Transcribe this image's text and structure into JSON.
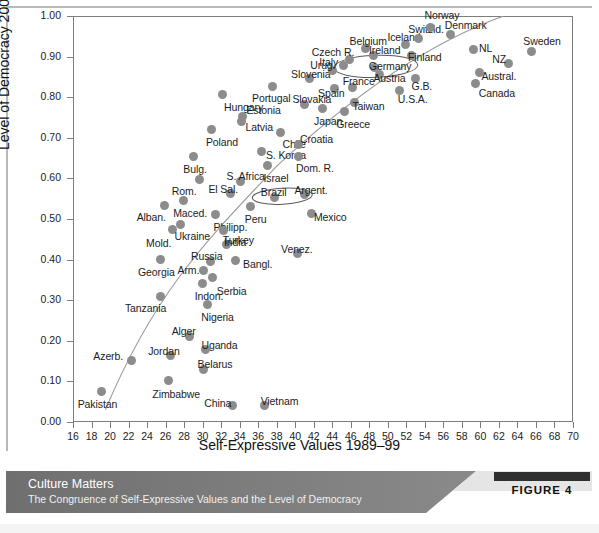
{
  "chart_data": {
    "type": "scatter",
    "title": "",
    "xlabel": "Self-Expressive Values 1989–99",
    "ylabel": "Level of Democracy 2000–04",
    "xlim": [
      16,
      70
    ],
    "ylim": [
      0.0,
      1.0
    ],
    "xticks": [
      16,
      18,
      20,
      22,
      24,
      26,
      28,
      30,
      32,
      34,
      36,
      38,
      40,
      42,
      44,
      46,
      48,
      50,
      52,
      54,
      56,
      58,
      60,
      62,
      64,
      66,
      68,
      70
    ],
    "yticks": [
      "0.00",
      "0.10",
      "0.20",
      "0.30",
      "0.40",
      "0.50",
      "0.60",
      "0.70",
      "0.80",
      "0.90",
      "1.00"
    ],
    "grid": false,
    "legend": "none",
    "marker_color": "#8c8c8c",
    "trendline_color": "#9a9a9a",
    "annotations": [
      {
        "name": "germany-ellipse",
        "label": "Germany"
      },
      {
        "name": "brazil-ellipse",
        "label": "Brazil"
      }
    ],
    "points": [
      {
        "label": "Pakistan",
        "x": 19.1,
        "y": 0.075,
        "lx": -24,
        "ly": 12
      },
      {
        "label": "Azerb.",
        "x": 22.3,
        "y": 0.152,
        "lx": -38,
        "ly": -4
      },
      {
        "label": "Tanzania",
        "x": 25.5,
        "y": 0.31,
        "lx": -36,
        "ly": 12
      },
      {
        "label": "Georgia",
        "x": 25.4,
        "y": 0.4,
        "lx": -22,
        "ly": 12
      },
      {
        "label": "Zimbabwe",
        "x": 26.3,
        "y": 0.101,
        "lx": -16,
        "ly": 13
      },
      {
        "label": "Jordan",
        "x": 26.5,
        "y": 0.163,
        "lx": -22,
        "ly": -5
      },
      {
        "label": "Alban.",
        "x": 25.9,
        "y": 0.534,
        "lx": -28,
        "ly": 12
      },
      {
        "label": "Mold.",
        "x": 26.7,
        "y": 0.474,
        "lx": -26,
        "ly": 13
      },
      {
        "label": "Maced.",
        "x": 27.9,
        "y": 0.545,
        "lx": -10,
        "ly": 12
      },
      {
        "label": "Ukraine",
        "x": 27.6,
        "y": 0.487,
        "lx": -6,
        "ly": 12
      },
      {
        "label": "Alger",
        "x": 28.6,
        "y": 0.211,
        "lx": -18,
        "ly": -5
      },
      {
        "label": "Uganda",
        "x": 30.3,
        "y": 0.178,
        "lx": -4,
        "ly": -5
      },
      {
        "label": "Belarus",
        "x": 30.1,
        "y": 0.13,
        "lx": -6,
        "ly": -5
      },
      {
        "label": "Nigeria",
        "x": 30.5,
        "y": 0.289,
        "lx": -6,
        "ly": 12
      },
      {
        "label": "Russia",
        "x": 30.9,
        "y": 0.396,
        "lx": -20,
        "ly": -5
      },
      {
        "label": "Arm.",
        "x": 30.1,
        "y": 0.372,
        "lx": -26,
        "ly": -1
      },
      {
        "label": "Indon.",
        "x": 30.0,
        "y": 0.342,
        "lx": -8,
        "ly": 13
      },
      {
        "label": "Serbia",
        "x": 31.1,
        "y": 0.355,
        "lx": 4,
        "ly": 13
      },
      {
        "label": "Bangl.",
        "x": 33.5,
        "y": 0.398,
        "lx": 8,
        "ly": 4
      },
      {
        "label": "Turkey",
        "x": 32.6,
        "y": 0.437,
        "lx": -4,
        "ly": -5
      },
      {
        "label": "China",
        "x": 33.2,
        "y": 0.04,
        "lx": -28,
        "ly": -3
      },
      {
        "label": "Vietnam",
        "x": 36.7,
        "y": 0.04,
        "lx": -4,
        "ly": -5
      },
      {
        "label": "Rom.",
        "x": 29.7,
        "y": 0.598,
        "lx": -28,
        "ly": 12
      },
      {
        "label": "Bulg.",
        "x": 29.0,
        "y": 0.655,
        "lx": -10,
        "ly": 13
      },
      {
        "label": "Philipp.",
        "x": 31.4,
        "y": 0.511,
        "lx": -2,
        "ly": 12
      },
      {
        "label": "India",
        "x": 32.3,
        "y": 0.472,
        "lx": 0,
        "ly": 12
      },
      {
        "label": "Poland",
        "x": 31.0,
        "y": 0.721,
        "lx": -6,
        "ly": 13
      },
      {
        "label": "Hungary",
        "x": 32.1,
        "y": 0.806,
        "lx": 2,
        "ly": 12
      },
      {
        "label": "El Sal.",
        "x": 33.0,
        "y": 0.562,
        "lx": -22,
        "ly": -5
      },
      {
        "label": "S. Africa",
        "x": 34.1,
        "y": 0.593,
        "lx": -14,
        "ly": -5
      },
      {
        "label": "Latvia",
        "x": 34.2,
        "y": 0.739,
        "lx": 4,
        "ly": 5
      },
      {
        "label": "Estonia",
        "x": 34.3,
        "y": 0.752,
        "lx": 4,
        "ly": -7
      },
      {
        "label": "Venez.",
        "x": 40.2,
        "y": 0.415,
        "lx": -16,
        "ly": -5
      },
      {
        "label": "Peru",
        "x": 35.2,
        "y": 0.53,
        "lx": -6,
        "ly": 12
      },
      {
        "label": "Brazil",
        "x": 37.8,
        "y": 0.553,
        "lx": -14,
        "ly": -5
      },
      {
        "label": "Israel",
        "x": 37.0,
        "y": 0.631,
        "lx": -4,
        "ly": 12
      },
      {
        "label": "S. Korea",
        "x": 36.4,
        "y": 0.666,
        "lx": 4,
        "ly": 3
      },
      {
        "label": "Portugal",
        "x": 37.5,
        "y": 0.827,
        "lx": -20,
        "ly": 12
      },
      {
        "label": "Chile",
        "x": 38.4,
        "y": 0.714,
        "lx": 2,
        "ly": 12
      },
      {
        "label": "Argent.",
        "x": 41.0,
        "y": 0.56,
        "lx": -10,
        "ly": -5
      },
      {
        "label": "Mexico",
        "x": 41.8,
        "y": 0.513,
        "lx": 2,
        "ly": 3
      },
      {
        "label": "Dom. R.",
        "x": 40.3,
        "y": 0.655,
        "lx": -2,
        "ly": 12
      },
      {
        "label": "Croatia",
        "x": 40.4,
        "y": 0.683,
        "lx": 1,
        "ly": -6
      },
      {
        "label": "Japan",
        "x": 42.9,
        "y": 0.772,
        "lx": -8,
        "ly": 12
      },
      {
        "label": "Slovakia",
        "x": 41.0,
        "y": 0.783,
        "lx": -12,
        "ly": -5
      },
      {
        "label": "Slovenia",
        "x": 41.5,
        "y": 0.845,
        "lx": -18,
        "ly": -5
      },
      {
        "label": "Spain",
        "x": 44.2,
        "y": 0.822,
        "lx": -16,
        "ly": 5
      },
      {
        "label": "Greece",
        "x": 45.3,
        "y": 0.766,
        "lx": -8,
        "ly": 13
      },
      {
        "label": "Taiwan",
        "x": 46.4,
        "y": 0.788,
        "lx": -2,
        "ly": 4
      },
      {
        "label": "Urug.",
        "x": 44.0,
        "y": 0.866,
        "lx": -22,
        "ly": -5
      },
      {
        "label": "Italy",
        "x": 45.2,
        "y": 0.878,
        "lx": -24,
        "ly": -4
      },
      {
        "label": "Czech R.",
        "x": 45.9,
        "y": 0.893,
        "lx": -38,
        "ly": -7
      },
      {
        "label": "France",
        "x": 46.2,
        "y": 0.824,
        "lx": -10,
        "ly": -6
      },
      {
        "label": "Belgium",
        "x": 47.6,
        "y": 0.92,
        "lx": -16,
        "ly": -7
      },
      {
        "label": "Ireland",
        "x": 48.4,
        "y": 0.903,
        "lx": -4,
        "ly": -5
      },
      {
        "label": "Germany",
        "x": 48.6,
        "y": 0.873,
        "lx": -6,
        "ly": -2
      },
      {
        "label": "Austria",
        "x": 49.1,
        "y": 0.855,
        "lx": -6,
        "ly": 3
      },
      {
        "label": "U.S.A.",
        "x": 51.3,
        "y": 0.817,
        "lx": -2,
        "ly": 9
      },
      {
        "label": "Iceland",
        "x": 51.9,
        "y": 0.93,
        "lx": -18,
        "ly": -7
      },
      {
        "label": "Finland",
        "x": 52.6,
        "y": 0.902,
        "lx": -4,
        "ly": 1
      },
      {
        "label": "Switzld.",
        "x": 53.3,
        "y": 0.945,
        "lx": -10,
        "ly": -9
      },
      {
        "label": "Norway",
        "x": 54.6,
        "y": 0.972,
        "lx": -6,
        "ly": -12
      },
      {
        "label": "G.B.",
        "x": 53.0,
        "y": 0.845,
        "lx": -4,
        "ly": 7
      },
      {
        "label": "Denmark",
        "x": 56.8,
        "y": 0.955,
        "lx": -6,
        "ly": -9
      },
      {
        "label": "NL",
        "x": 59.2,
        "y": 0.918,
        "lx": 6,
        "ly": -1
      },
      {
        "label": "Austral.",
        "x": 59.9,
        "y": 0.862,
        "lx": 2,
        "ly": 4
      },
      {
        "label": "Canada",
        "x": 59.5,
        "y": 0.833,
        "lx": 3,
        "ly": 9
      },
      {
        "label": "NZ",
        "x": 63.0,
        "y": 0.884,
        "lx": -16,
        "ly": -4
      },
      {
        "label": "Sweden",
        "x": 65.5,
        "y": 0.912,
        "lx": -8,
        "ly": -11
      }
    ]
  },
  "caption": {
    "title": "Culture Matters",
    "subtitle": "The Congruence of Self-Expressive Values and the Level of Democracy",
    "figure_label": "FIGURE 4"
  }
}
